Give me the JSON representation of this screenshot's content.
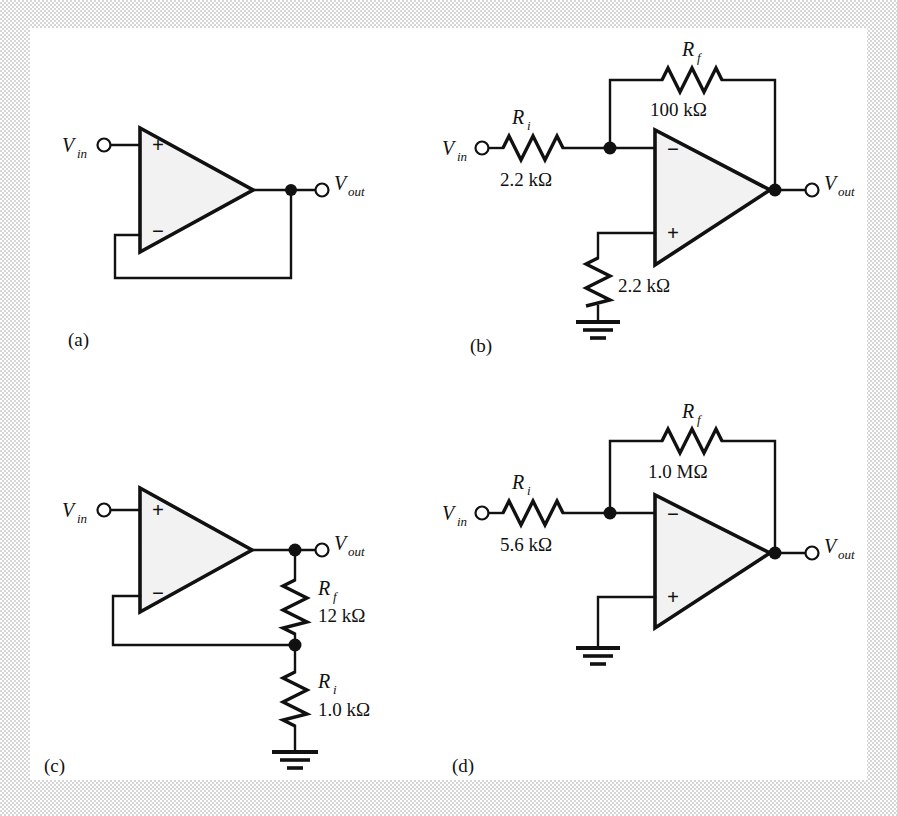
{
  "figure": {
    "panels": [
      {
        "id": "a",
        "label": "(a)",
        "circuit_name": "voltage-follower",
        "input_label": "V",
        "input_sub": "in",
        "output_label": "V",
        "output_sub": "out",
        "plus_sign": "+",
        "minus_sign": "−",
        "components": []
      },
      {
        "id": "b",
        "label": "(b)",
        "circuit_name": "inverting-amplifier",
        "input_label": "V",
        "input_sub": "in",
        "output_label": "V",
        "output_sub": "out",
        "plus_sign": "+",
        "minus_sign": "−",
        "components": [
          {
            "name": "R",
            "sub": "i",
            "value": "2.2 kΩ"
          },
          {
            "name": "R",
            "sub": "f",
            "value": "100 kΩ"
          },
          {
            "name": "",
            "sub": "",
            "value": "2.2 kΩ"
          }
        ]
      },
      {
        "id": "c",
        "label": "(c)",
        "circuit_name": "non-inverting-amplifier",
        "input_label": "V",
        "input_sub": "in",
        "output_label": "V",
        "output_sub": "out",
        "plus_sign": "+",
        "minus_sign": "−",
        "components": [
          {
            "name": "R",
            "sub": "f",
            "value": "12 kΩ"
          },
          {
            "name": "R",
            "sub": "i",
            "value": "1.0 kΩ"
          }
        ]
      },
      {
        "id": "d",
        "label": "(d)",
        "circuit_name": "inverting-amplifier",
        "input_label": "V",
        "input_sub": "in",
        "output_label": "V",
        "output_sub": "out",
        "plus_sign": "+",
        "minus_sign": "−",
        "components": [
          {
            "name": "R",
            "sub": "i",
            "value": "5.6 kΩ"
          },
          {
            "name": "R",
            "sub": "f",
            "value": "1.0 MΩ"
          }
        ]
      }
    ]
  },
  "panel_a": {
    "label": "(a)",
    "vin": "V",
    "vin_sub": "in",
    "vout": "V",
    "vout_sub": "out",
    "plus": "+",
    "minus": "−"
  },
  "panel_b": {
    "label": "(b)",
    "vin": "V",
    "vin_sub": "in",
    "vout": "V",
    "vout_sub": "out",
    "plus": "+",
    "minus": "−",
    "ri_name": "R",
    "ri_sub": "i",
    "ri_value": "2.2 kΩ",
    "rf_name": "R",
    "rf_sub": "f",
    "rf_value": "100 kΩ",
    "rg_value": "2.2 kΩ"
  },
  "panel_c": {
    "label": "(c)",
    "vin": "V",
    "vin_sub": "in",
    "vout": "V",
    "vout_sub": "out",
    "plus": "+",
    "minus": "−",
    "rf_name": "R",
    "rf_sub": "f",
    "rf_value": "12 kΩ",
    "ri_name": "R",
    "ri_sub": "i",
    "ri_value": "1.0 kΩ"
  },
  "panel_d": {
    "label": "(d)",
    "vin": "V",
    "vin_sub": "in",
    "vout": "V",
    "vout_sub": "out",
    "plus": "+",
    "minus": "−",
    "ri_name": "R",
    "ri_sub": "i",
    "ri_value": "5.6 kΩ",
    "rf_name": "R",
    "rf_sub": "f",
    "rf_value": "1.0 MΩ"
  },
  "colors": {
    "ink": "#111111",
    "opamp_fill": "#f2f2f2",
    "paper": "#ffffff",
    "border_gray": "#c9c9c9"
  }
}
